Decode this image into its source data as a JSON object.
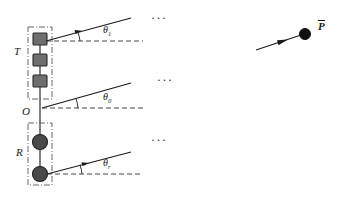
{
  "figure": {
    "colors": {
      "line": "#1a1a1a",
      "tx_element_fill": "#6e6e6e",
      "tx_element_stroke": "#2b2b2b",
      "rx_element_fill": "#4a4a4a",
      "rx_element_stroke": "#1f1f1f",
      "dashdot_box": "#555555",
      "dashed_axis": "#333333",
      "background": "#ffffff"
    }
  },
  "labels": {
    "transmit_array": "T",
    "receive_array": "R",
    "origin": "O",
    "target_point": "P"
  },
  "angles": [
    {
      "id": "theta-1",
      "symbol": "θ",
      "subscript": "1",
      "ray": "upper"
    },
    {
      "id": "theta-0",
      "symbol": "θ",
      "subscript": "0",
      "ray": "middle"
    },
    {
      "id": "theta-r",
      "symbol": "θ",
      "subscript": "r",
      "ray": "lower"
    }
  ],
  "ellipses": [
    {
      "id": "ellipsis-upper",
      "text": "···"
    },
    {
      "id": "ellipsis-middle",
      "text": "···"
    },
    {
      "id": "ellipsis-lower",
      "text": "···"
    }
  ],
  "transmit_elements": [
    {
      "id": "tx-element-1",
      "shape": "square"
    },
    {
      "id": "tx-element-2",
      "shape": "square"
    },
    {
      "id": "tx-element-3",
      "shape": "square"
    }
  ],
  "receive_elements": [
    {
      "id": "rx-element-1",
      "shape": "circle"
    },
    {
      "id": "rx-element-2",
      "shape": "circle"
    }
  ]
}
